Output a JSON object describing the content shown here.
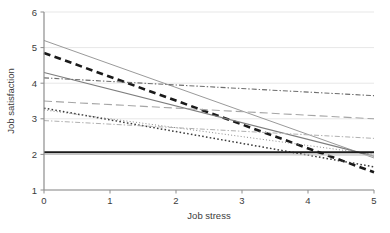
{
  "chart_data": {
    "type": "line",
    "title": "",
    "xlabel": "Job stress",
    "ylabel": "Job satisfaction",
    "xlim": [
      0,
      5
    ],
    "ylim": [
      1,
      6
    ],
    "xticks": [
      0,
      1,
      2,
      3,
      4,
      5
    ],
    "yticks": [
      1,
      2,
      3,
      4,
      5,
      6
    ],
    "xtick_labels": [
      "0",
      "1",
      "2",
      "3",
      "4",
      "5"
    ],
    "ytick_labels": [
      "1",
      "2",
      "3",
      "4",
      "5",
      "6"
    ],
    "grid": "horizontal-light",
    "legend": "none",
    "x": [
      0,
      5
    ],
    "series": [
      {
        "name": "group-1-thin-gray-solid",
        "style": "solid",
        "color": "#9a9a9a",
        "width": 1.0,
        "values": [
          5.2,
          1.9
        ]
      },
      {
        "name": "group-2-thick-black-dashed",
        "style": "dashed",
        "color": "#1a1a1a",
        "width": 2.6,
        "values": [
          4.85,
          1.5
        ]
      },
      {
        "name": "group-3-gray-solid",
        "style": "solid",
        "color": "#7d7d7d",
        "width": 1.2,
        "values": [
          4.3,
          1.95
        ]
      },
      {
        "name": "group-4-dash-dot",
        "style": "dash-dot",
        "color": "#6e6e6e",
        "width": 1.1,
        "values": [
          4.15,
          3.65
        ]
      },
      {
        "name": "group-5-long-dash",
        "style": "long-dash",
        "color": "#a5a5a5",
        "width": 1.1,
        "values": [
          3.5,
          3.0
        ]
      },
      {
        "name": "group-6-dotted-coarse",
        "style": "dotted",
        "color": "#3a3a3a",
        "width": 1.5,
        "values": [
          3.3,
          1.65
        ]
      },
      {
        "name": "group-7-dotted-fine",
        "style": "fine-dotted",
        "color": "#8c8c8c",
        "width": 1.0,
        "values": [
          3.25,
          2.0
        ]
      },
      {
        "name": "group-8-light-dash-dot",
        "style": "dash-dot",
        "color": "#b0b0b0",
        "width": 1.0,
        "values": [
          2.95,
          2.45
        ]
      },
      {
        "name": "group-9-thick-black-flat",
        "style": "solid",
        "color": "#1a1a1a",
        "width": 2.0,
        "values": [
          2.06,
          2.06
        ]
      },
      {
        "name": "group-10-thin-gray-flat",
        "style": "solid",
        "color": "#c4c4c4",
        "width": 1.0,
        "values": [
          2.0,
          1.98
        ]
      }
    ]
  },
  "axes": {
    "frame_color": "#8d8d8d",
    "gridline_color": "#e4e4e4",
    "text_color": "#3b3b3b"
  }
}
